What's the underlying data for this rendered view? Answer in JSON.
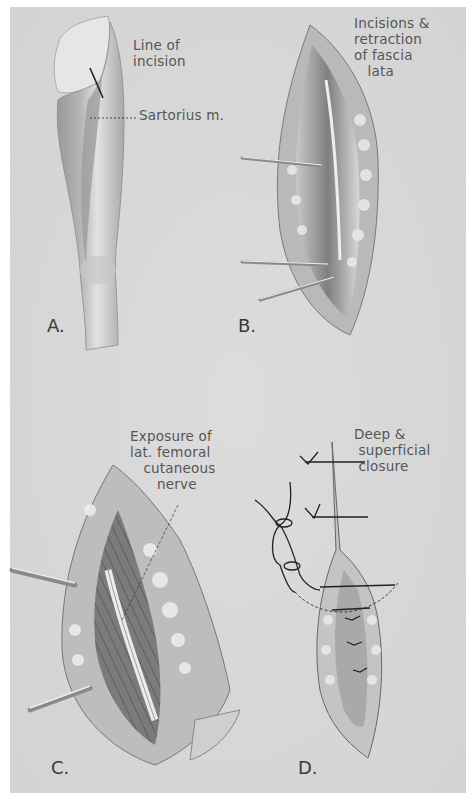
{
  "plate": {
    "background_color": "#d6d6d6",
    "margin_color": "#ffffff"
  },
  "panels": [
    {
      "id": "A",
      "letter": "A.",
      "subject": "thigh-with-incision-line",
      "labels": {
        "line_of_incision": "Line of\nincision",
        "sartorius": "Sartorius m."
      }
    },
    {
      "id": "B",
      "letter": "B.",
      "subject": "incision-retracted-fascia-lata",
      "labels": {
        "caption": "Incisions &\nretraction\nof fascia\n   lata"
      }
    },
    {
      "id": "C",
      "letter": "C.",
      "subject": "exposure-of-nerve",
      "labels": {
        "caption": "Exposure of\nlat. femoral\n   cutaneous\n      nerve"
      }
    },
    {
      "id": "D",
      "letter": "D.",
      "subject": "deep-and-superficial-closure",
      "labels": {
        "caption": "Deep &\n superficial\n closure"
      }
    }
  ]
}
